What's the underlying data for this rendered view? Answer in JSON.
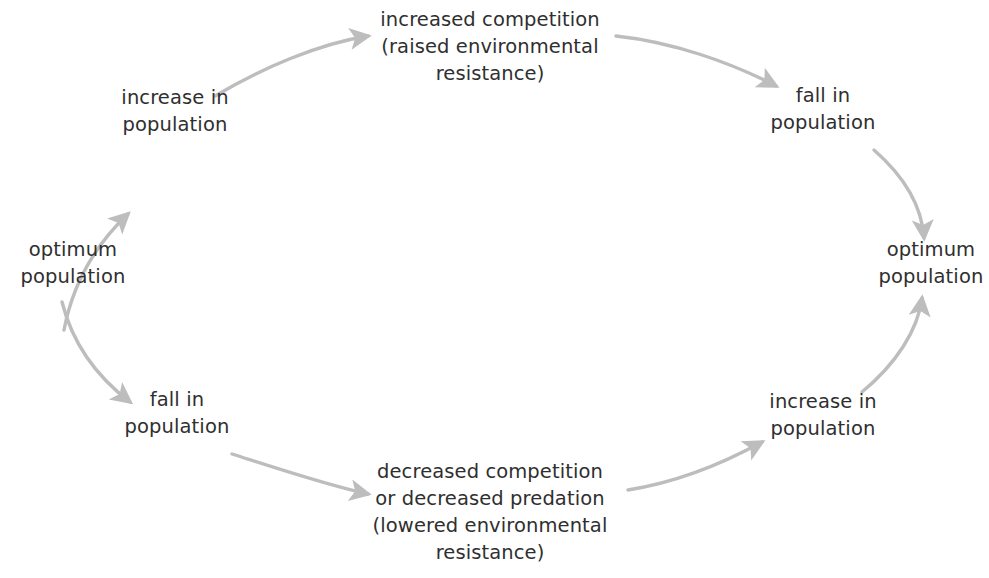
{
  "diagram": {
    "type": "cycle-flow",
    "background_color": "#ffffff",
    "text_color": "#2f2f2f",
    "arrow_color": "#bdbdbd",
    "nodes": [
      {
        "id": "optimum-population-left",
        "lines": [
          "optimum",
          "population"
        ],
        "position": "left-middle"
      },
      {
        "id": "increase-in-population-top-left",
        "lines": [
          "increase in",
          "population"
        ],
        "position": "upper-left"
      },
      {
        "id": "increased-competition",
        "lines": [
          "increased competition",
          "(raised environmental",
          "resistance)"
        ],
        "position": "top-center"
      },
      {
        "id": "fall-in-population-top-right",
        "lines": [
          "fall in",
          "population"
        ],
        "position": "upper-right"
      },
      {
        "id": "optimum-population-right",
        "lines": [
          "optimum",
          "population"
        ],
        "position": "right-middle"
      },
      {
        "id": "increase-in-population-bottom-right",
        "lines": [
          "increase in",
          "population"
        ],
        "position": "lower-right"
      },
      {
        "id": "decreased-competition",
        "lines": [
          "decreased competition",
          "or decreased predation",
          "(lowered environmental",
          "resistance)"
        ],
        "position": "bottom-center"
      },
      {
        "id": "fall-in-population-bottom-left",
        "lines": [
          "fall in",
          "population"
        ],
        "position": "lower-left"
      }
    ],
    "edges": [
      {
        "from": "optimum-population-left",
        "to": "increase-in-population-top-left"
      },
      {
        "from": "increase-in-population-top-left",
        "to": "increased-competition"
      },
      {
        "from": "increased-competition",
        "to": "fall-in-population-top-right"
      },
      {
        "from": "fall-in-population-top-right",
        "to": "optimum-population-right"
      },
      {
        "from": "optimum-population-left",
        "to": "fall-in-population-bottom-left"
      },
      {
        "from": "fall-in-population-bottom-left",
        "to": "decreased-competition"
      },
      {
        "from": "decreased-competition",
        "to": "increase-in-population-bottom-right"
      },
      {
        "from": "increase-in-population-bottom-right",
        "to": "optimum-population-right"
      }
    ]
  }
}
